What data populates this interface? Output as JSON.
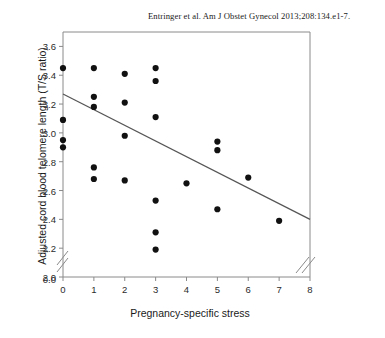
{
  "citation": "Entringer et al. Am J Obstet Gynecol 2013;208:134.e1-7.",
  "chart_data": {
    "type": "scatter",
    "title": "",
    "citation": "Entringer et al. Am J Obstet Gynecol 2013;208:134.e1-7.",
    "xlabel": "Pregnancy-specific stress",
    "ylabel": "Adjusted cord blood telomere length (T/S ratio)",
    "xlim": [
      0,
      8
    ],
    "ylim": [
      2.0,
      3.7
    ],
    "grid": false,
    "legend": null,
    "axis_break_y": true,
    "axis_break_x": true,
    "y_zero_label": "0.0",
    "xticks": [
      0,
      1,
      2,
      3,
      4,
      5,
      6,
      7,
      8
    ],
    "xtick_labels": [
      "0",
      "1",
      "2",
      "3",
      "4",
      "5",
      "6",
      "7",
      "8"
    ],
    "yticks": [
      2.0,
      2.2,
      2.4,
      2.6,
      2.8,
      3.0,
      3.2,
      3.4,
      3.6
    ],
    "ytick_labels": [
      "2.0",
      "2.2",
      "2.4",
      "2.6",
      "2.8",
      "3.0",
      "3.2",
      "3.4",
      "3.6"
    ],
    "marker": "filled-circle",
    "marker_color": "#111111",
    "line_color": "#555555",
    "points": [
      {
        "x": 0,
        "y": 3.45
      },
      {
        "x": 0,
        "y": 3.09
      },
      {
        "x": 0,
        "y": 2.95
      },
      {
        "x": 0,
        "y": 2.9
      },
      {
        "x": 1,
        "y": 3.45
      },
      {
        "x": 1,
        "y": 3.25
      },
      {
        "x": 1,
        "y": 3.18
      },
      {
        "x": 1,
        "y": 2.76
      },
      {
        "x": 1,
        "y": 2.68
      },
      {
        "x": 2,
        "y": 3.41
      },
      {
        "x": 2,
        "y": 3.21
      },
      {
        "x": 2,
        "y": 2.98
      },
      {
        "x": 2,
        "y": 2.67
      },
      {
        "x": 3,
        "y": 3.45
      },
      {
        "x": 3,
        "y": 3.36
      },
      {
        "x": 3,
        "y": 3.11
      },
      {
        "x": 3,
        "y": 2.53
      },
      {
        "x": 3,
        "y": 2.31
      },
      {
        "x": 3,
        "y": 2.19
      },
      {
        "x": 4,
        "y": 2.65
      },
      {
        "x": 5,
        "y": 2.94
      },
      {
        "x": 5,
        "y": 2.88
      },
      {
        "x": 5,
        "y": 2.47
      },
      {
        "x": 6,
        "y": 2.69
      },
      {
        "x": 7,
        "y": 2.39
      }
    ],
    "regression_line": {
      "x_start": 0,
      "y_start": 3.27,
      "x_end": 8,
      "y_end": 2.4
    }
  }
}
